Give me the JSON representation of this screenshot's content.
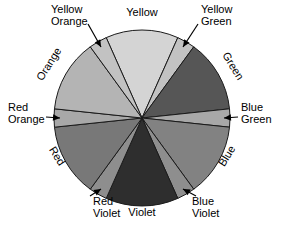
{
  "diagram": {
    "background_color": "#ffffff",
    "outline_color": "#1a1a1a",
    "center": {
      "x": 142,
      "y": 118
    },
    "radius": 88
  },
  "chart_data": {
    "type": "pie",
    "categories": [
      "Yellow",
      "Yellow Green",
      "Green",
      "Blue Green",
      "Blue",
      "Blue Violet",
      "Violet",
      "Red Violet",
      "Red",
      "Red Orange",
      "Orange",
      "Yellow Orange"
    ],
    "values": [
      48,
      12,
      48,
      12,
      48,
      12,
      48,
      12,
      48,
      12,
      48,
      12
    ],
    "legend": "none",
    "grid": false
  },
  "wedges": [
    {
      "id": "yellow",
      "label": "Yellow",
      "kind": "primary",
      "color": "#d4d4d4",
      "start_angle": -114,
      "end_angle": -66,
      "label_style": "horizontal-outside",
      "label_x": 142,
      "label_y": 16
    },
    {
      "id": "yellow-green",
      "label": "Yellow Green",
      "line1": "Yellow",
      "line2": "Green",
      "kind": "tertiary",
      "color": "#c2c2c2",
      "start_angle": -66,
      "end_angle": -54,
      "label_style": "callout",
      "label_x": 201,
      "label_y": 13
    },
    {
      "id": "green",
      "label": "Green",
      "kind": "secondary",
      "color": "#565656",
      "start_angle": -54,
      "end_angle": -6,
      "label_style": "rotated-arc",
      "label_x": 230,
      "label_y": 68,
      "rotation": 58
    },
    {
      "id": "blue-green",
      "label": "Blue Green",
      "line1": "Blue",
      "line2": "Green",
      "kind": "tertiary",
      "color": "#a8a8a8",
      "start_angle": -6,
      "end_angle": 6,
      "label_style": "callout",
      "label_x": 241,
      "label_y": 111
    },
    {
      "id": "blue",
      "label": "Blue",
      "kind": "primary",
      "color": "#828282",
      "start_angle": 6,
      "end_angle": 54,
      "label_style": "rotated-arc",
      "label_x": 230,
      "label_y": 158,
      "rotation": -58
    },
    {
      "id": "blue-violet",
      "label": "Blue Violet",
      "line1": "Blue",
      "line2": "Violet",
      "kind": "tertiary",
      "color": "#8e8e8e",
      "start_angle": 54,
      "end_angle": 66,
      "label_style": "callout",
      "label_x": 192,
      "label_y": 205
    },
    {
      "id": "violet",
      "label": "Violet",
      "kind": "secondary",
      "color": "#2e2e2e",
      "start_angle": 66,
      "end_angle": 114,
      "label_style": "horizontal-outside",
      "label_x": 142,
      "label_y": 216
    },
    {
      "id": "red-violet",
      "label": "Red Violet",
      "line1": "Red",
      "line2": "Violet",
      "kind": "tertiary",
      "color": "#8e8e8e",
      "start_angle": 114,
      "end_angle": 126,
      "label_style": "callout",
      "label_x": 93,
      "label_y": 205
    },
    {
      "id": "red",
      "label": "Red",
      "kind": "primary",
      "color": "#787878",
      "start_angle": 126,
      "end_angle": 174,
      "label_style": "rotated-arc",
      "label_x": 54,
      "label_y": 158,
      "rotation": 58
    },
    {
      "id": "red-orange",
      "label": "Red Orange",
      "line1": "Red",
      "line2": "Orange",
      "kind": "tertiary",
      "color": "#a8a8a8",
      "start_angle": 174,
      "end_angle": 186,
      "label_style": "callout",
      "label_x": 8,
      "label_y": 111
    },
    {
      "id": "orange",
      "label": "Orange",
      "kind": "secondary",
      "color": "#b4b4b4",
      "start_angle": -174,
      "end_angle": -126,
      "label_style": "rotated-arc",
      "label_x": 52,
      "label_y": 66,
      "rotation": -58
    },
    {
      "id": "yellow-orange",
      "label": "Yellow Orange",
      "line1": "Yellow",
      "line2": "Orange",
      "kind": "tertiary",
      "color": "#c2c2c2",
      "start_angle": -126,
      "end_angle": -114,
      "label_style": "callout",
      "label_x": 51,
      "label_y": 13
    }
  ]
}
